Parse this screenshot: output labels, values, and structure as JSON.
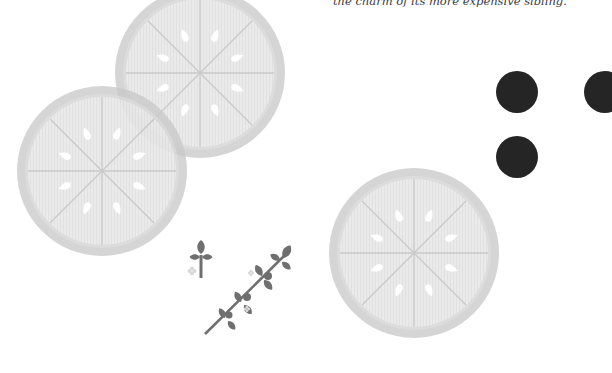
{
  "caption": {
    "lines": [
      "                                                          ",
      "the charm of its more expensive sibling."
    ]
  },
  "colors": {
    "slice_rind": "#c9c9c9",
    "slice_flesh": "#e6e6e6",
    "slice_segment_line": "#c4c4c4",
    "slice_seed": "#ffffff",
    "dot": "#252525",
    "sprig": "#6f6f6f",
    "flower": "#d8d8d8"
  },
  "illustration": {
    "slices": [
      {
        "cx": 200,
        "cy": 73,
        "r": 84
      },
      {
        "cx": 102,
        "cy": 171,
        "r": 85
      },
      {
        "cx": 414,
        "cy": 253,
        "r": 85
      }
    ],
    "dots": [
      {
        "cx": 517,
        "cy": 92,
        "r": 21
      },
      {
        "cx": 605,
        "cy": 92,
        "r": 21
      },
      {
        "cx": 517,
        "cy": 157,
        "r": 21
      }
    ]
  }
}
